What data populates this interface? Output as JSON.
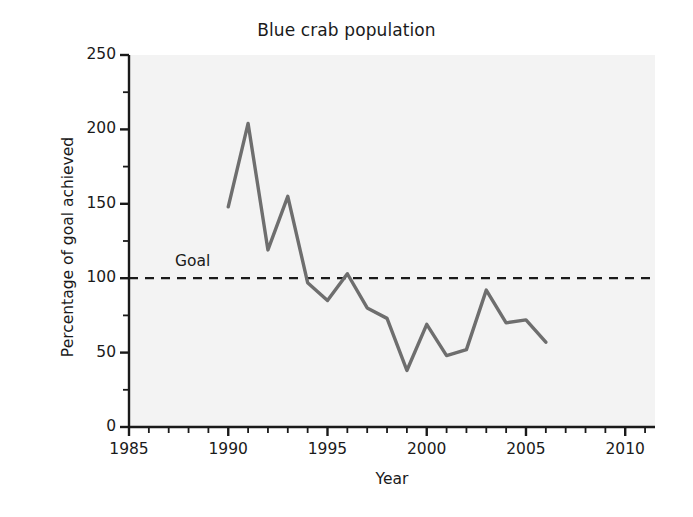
{
  "chart_data": {
    "type": "line",
    "title": "Blue crab population",
    "xlabel": "Year",
    "ylabel": "Percentage of goal achieved",
    "xlim": [
      1985,
      2011.5
    ],
    "ylim": [
      0,
      250
    ],
    "grid": false,
    "legend": null,
    "x_ticks": [
      1985,
      1990,
      1995,
      2000,
      2005,
      2010
    ],
    "x_tick_labels": [
      "1985",
      "1990",
      "1995",
      "2000",
      "2005",
      "2010"
    ],
    "x_minor_tick_step": 1,
    "y_ticks": [
      0,
      50,
      100,
      150,
      200,
      250
    ],
    "y_tick_labels": [
      "0",
      "50",
      "100",
      "150",
      "200",
      "250"
    ],
    "y_minor_tick_step": 25,
    "series": [
      {
        "name": "Blue crab population",
        "color": "#6e6e6e",
        "x": [
          1990,
          1991,
          1992,
          1993,
          1994,
          1995,
          1996,
          1997,
          1998,
          1999,
          2000,
          2001,
          2002,
          2003,
          2004,
          2005,
          2006
        ],
        "values": [
          148,
          204,
          119,
          155,
          97,
          85,
          103,
          80,
          73,
          38,
          69,
          48,
          52,
          92,
          70,
          72,
          57
        ]
      }
    ],
    "annotations": [
      {
        "name": "goal-line",
        "type": "hline",
        "label": "Goal",
        "value": 100,
        "style": "dashed",
        "color": "#1a1a1a"
      }
    ],
    "plot_background": "#f3f3f3",
    "axis_color": "#1a1a1a"
  }
}
